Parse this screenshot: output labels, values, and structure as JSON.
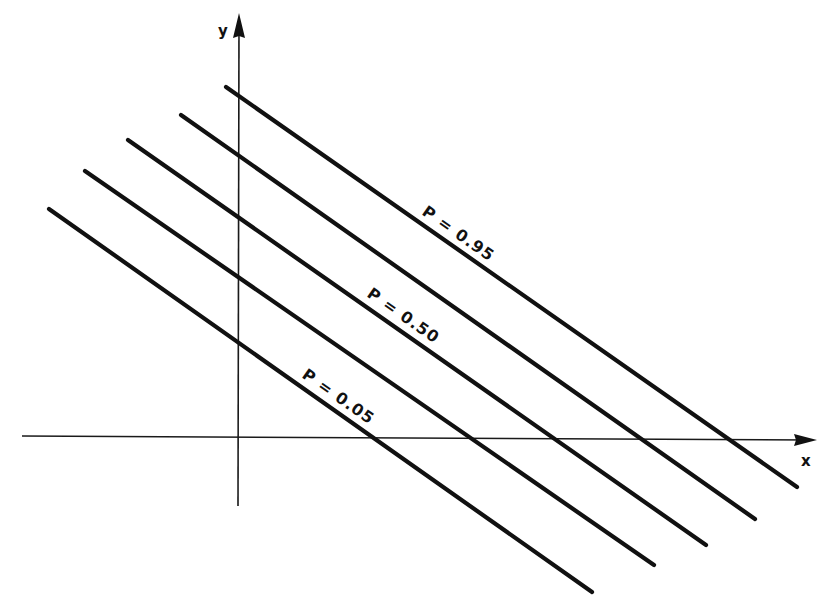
{
  "diagram": {
    "type": "iso-probability lines on x-y plane",
    "axes": {
      "x_label": "x",
      "y_label": "y",
      "x_axis": {
        "x1": 22,
        "y1": 436,
        "x2": 810,
        "y2": 440
      },
      "y_axis": {
        "x1": 239,
        "y1": 20,
        "x2": 238,
        "y2": 506
      }
    },
    "lines": [
      {
        "id": "line-1",
        "x1": 49,
        "y1": 209,
        "x2": 592,
        "y2": 592,
        "label": "P = 0.05"
      },
      {
        "id": "line-2",
        "x1": 85,
        "y1": 171,
        "x2": 654,
        "y2": 565,
        "label": ""
      },
      {
        "id": "line-3",
        "x1": 128,
        "y1": 140,
        "x2": 706,
        "y2": 545,
        "label": "P = 0.50"
      },
      {
        "id": "line-4",
        "x1": 181,
        "y1": 115,
        "x2": 755,
        "y2": 519,
        "label": ""
      },
      {
        "id": "line-5",
        "x1": 226,
        "y1": 87,
        "x2": 797,
        "y2": 487,
        "label": "P = 0.95"
      }
    ],
    "labels": [
      {
        "text": "P = 0.95",
        "x": 421,
        "y": 214,
        "rotation": 35
      },
      {
        "text": "P = 0.50",
        "x": 366,
        "y": 296,
        "rotation": 35
      },
      {
        "text": "P = 0.05",
        "x": 301,
        "y": 377,
        "rotation": 35
      }
    ]
  },
  "colors": {
    "background": "#ffffff",
    "ink": "#111111"
  }
}
